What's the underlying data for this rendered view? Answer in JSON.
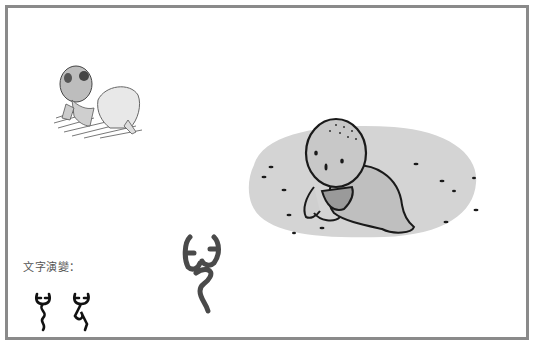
{
  "figure": {
    "caption": "文字演變：",
    "illustrations": [
      {
        "name": "pencil-sketch-crawling-baby",
        "style": "pencil sketch"
      },
      {
        "name": "cartoon-crawling-baby-on-rug",
        "style": "cartoon with grey rug"
      }
    ],
    "glyphs": [
      {
        "name": "oracle-bone-glyph-1"
      },
      {
        "name": "oracle-bone-glyph-2"
      },
      {
        "name": "seal-script-glyph-large"
      }
    ],
    "colors": {
      "frame": "#8a8a8a",
      "rug": "#d4d4d4",
      "ink": "#1a1a1a",
      "glyph_large": "#4a4a4a"
    }
  }
}
